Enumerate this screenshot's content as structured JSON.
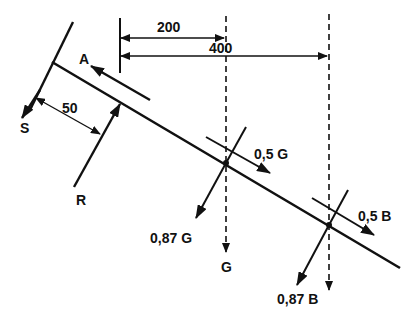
{
  "diagram": {
    "type": "force-diagram-inclined-beam",
    "colors": {
      "ink": "#111111",
      "background": "#ffffff"
    },
    "dimensions": {
      "d200": "200",
      "d400": "400",
      "d50": "50"
    },
    "forces": {
      "A": "A",
      "S": "S",
      "R": "R",
      "G": "G",
      "G_parallel": "0,5 G",
      "G_perpendicular": "0,87 G",
      "B_parallel": "0,5 B",
      "B_perpendicular": "0,87 B"
    }
  }
}
